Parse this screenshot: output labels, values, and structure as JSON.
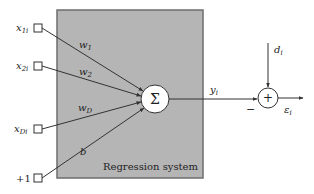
{
  "diagram": {
    "system_label": "Regression system",
    "inputs": [
      {
        "label": "x",
        "sub": "1i"
      },
      {
        "label": "x",
        "sub": "2i"
      },
      {
        "label": "x",
        "sub": "Di"
      },
      {
        "label": "+1",
        "sub": ""
      }
    ],
    "weights": [
      {
        "label": "w",
        "sub": "1"
      },
      {
        "label": "w",
        "sub": "2"
      },
      {
        "label": "w",
        "sub": "D"
      },
      {
        "label": "b",
        "sub": ""
      }
    ],
    "summation_symbol": "Σ",
    "output": {
      "label": "y",
      "sub": "i"
    },
    "desired": {
      "label": "d",
      "sub": "i"
    },
    "adder_symbol": "+",
    "minus_sign": "−",
    "error": {
      "label": "ε",
      "sub": "i"
    },
    "colors": {
      "system_box_fill": "#b5b5b5",
      "system_box_border": "#6e6e6e",
      "line": "#333333",
      "background": "#ffffff"
    }
  }
}
